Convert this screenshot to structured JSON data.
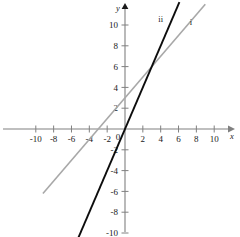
{
  "figure": {
    "kind": "coordinate-plane-line-graph",
    "background_color": "#ffffff",
    "width": 240,
    "height": 237
  },
  "chart_data": {
    "type": "line",
    "title": "",
    "subtitle": "",
    "xlabel": "x",
    "ylabel": "y",
    "xlim": [
      -11,
      11
    ],
    "ylim": [
      -11,
      11
    ],
    "grid": false,
    "legend_position": "inline-curve-labels",
    "axis_color": "#808080",
    "x_ticks": [
      -10,
      -8,
      -6,
      -4,
      -2,
      2,
      4,
      6,
      8,
      10
    ],
    "y_ticks": [
      10,
      8,
      6,
      4,
      2,
      -2,
      -4,
      -6,
      -8,
      -10
    ],
    "x_tick_labels": [
      "-10",
      "-8",
      "-6",
      "-4",
      "-2",
      "2",
      "4",
      "6",
      "8",
      "10"
    ],
    "y_tick_labels": [
      "10",
      "8",
      "6",
      "4",
      "2",
      "-2",
      "-4",
      "-6",
      "-8",
      "-10"
    ],
    "origin_label": "0",
    "x_axis_arrow": true,
    "y_axis_arrow": true,
    "intersection": {
      "x": 3,
      "y": 6
    },
    "series": [
      {
        "name": "i",
        "label": "i",
        "color": "#a8a8a8",
        "slope": 1,
        "intercept": 3,
        "x_intercept": -3,
        "y_intercept": 3,
        "equation": "y = x + 3",
        "x": [
          -9.2,
          9.0
        ],
        "values": [
          -6.2,
          12.0
        ],
        "label_position": {
          "x": 7.4,
          "y": 10.0
        },
        "line_width": 1.6
      },
      {
        "name": "ii",
        "label": "ii",
        "color": "#0d0d0d",
        "slope": 2,
        "intercept": 0,
        "x_intercept": 0,
        "y_intercept": 0,
        "equation": "y = 2x",
        "x": [
          -5.6,
          6.1
        ],
        "values": [
          -11.2,
          12.2
        ],
        "label_position": {
          "x": 4.0,
          "y": 10.3
        },
        "line_width": 1.9
      }
    ]
  }
}
